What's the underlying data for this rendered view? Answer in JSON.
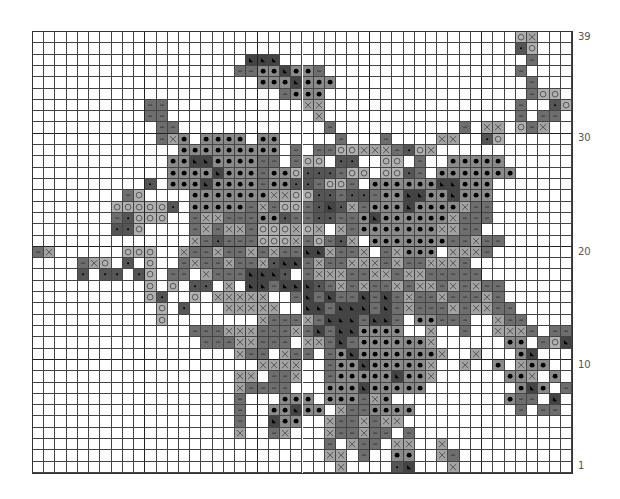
{
  "chart": {
    "columns": 48,
    "rows": 39,
    "major_grid_every": 10,
    "row_labels": [
      {
        "row": 39,
        "label": "39"
      },
      {
        "row": 30,
        "label": "30"
      },
      {
        "row": 20,
        "label": "20"
      },
      {
        "row": 10,
        "label": "10"
      },
      {
        "row": 1,
        "label": "1"
      }
    ],
    "symbols": {
      ".": {
        "name": "empty",
        "color": "#ffffff"
      },
      "-": {
        "name": "dash",
        "color": "#6e6e6e"
      },
      "x": {
        "name": "cross",
        "color": "#a3a3a3"
      },
      "o": {
        "name": "ring",
        "color": "#b0b0b0"
      },
      "O": {
        "name": "large-dot",
        "color": "#8a8a8a"
      },
      "d": {
        "name": "small-dot",
        "color": "#555555"
      },
      "t": {
        "name": "triangle",
        "color": "#444444"
      }
    },
    "grid_top_to_bottom": [
      "...........................................ox...",
      "...........................................do...",
      "...................ttt......................-...",
      "..................--OOtOO-.................-....",
      "....................OOOtOOO.................-...",
      "......................-OOO..................-oo.",
      "..........--............xx.................-..do",
      "..........--.............x.................-.--.",
      "...........--.............-...........-.xx.o-x..",
      "...........-xO.OOOO.OO.....-...-....xx..do......",
      ".............OOOOOOOOO.-.--ooxxx-dox...........",
      "............OOttOOOO--.-oo.dd..oo.-..OOOOO......",
      "............OOOOtOOO-OOoddd-oo.ood-.OOOOOOO.....",
      "..........d.OOOtOOOO-OOdd-oo-.OOOOOOttOOO.......",
      "........-o....OOOOOOOxxoodd-dd-OOttOOtOOO.......",
      ".......oooood.OOOOO-x-oo-dtdx-OOOtOOOOx--.......",
      ".......-dooo..-xx---OOd--dd--OtOOOOOOx---......",
      ".......ddo....-x-xx-oooxox.x-OOOOOOOxx--.......",
      "..............x-d---ooox-o-dx.OOOOOOO--x--.....",
      "-x......ooo..x--x--x-x--ttx--x.-xOOO.xxx-.......",
      "....-xo.d.o..-x--x--xdtt-x--xxx-x--xxx-.........",
      "....d.dd.do.--.x---tttd.-xxx--xx-xx-----........",
      "..........o.o.dd.x.tt-tttd-x-x--x-xx-x-x--......",
      "..........od..o.xxxxx..-t-t--t-t-x--x---x-.....",
      "...........o.d...xxxxx..tt-ttt-t-x---x-xx--.....",
      "...........o........x---x-ttt-tt-.OO---..x--....",
      "..............---xxx---x-t-ttOOOO..x..-..xxx-.--",
      "...............---xx---.xx-t-OOOOOOx......OO.-ot",
      "..................x--.x--.-OtOOOOOOOx..x...Ot...",
      "....................xxxx..-OOtOOOOOx..x..O.xOO..",
      "..................xx.--x..-OOOOOtOOx......OOx.O.",
      "..................x----...OOOtOOOOO........OtO.-",
      "..................-...OOO.OOO-xO..........O--.t.",
      "..................-..OOtOO.x--OOOO.........-.--.",
      "..................-..tOO..x--x-xx..............",
      "..................x..-x...x--x--.-.............",
      "..........................-.x--.xx..x...........",
      "..........................xx.-..OO..x-.........",
      "...........................x....dt...x..........."
    ]
  }
}
